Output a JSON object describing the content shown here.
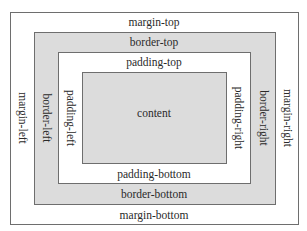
{
  "diagram": {
    "layers": {
      "margin": {
        "top": "margin-top",
        "bottom": "margin-bottom",
        "left": "margin-left",
        "right": "margin-right"
      },
      "border": {
        "top": "border-top",
        "bottom": "border-bottom",
        "left": "border-left",
        "right": "border-right"
      },
      "padding": {
        "top": "padding-top",
        "bottom": "padding-bottom",
        "left": "padding-left",
        "right": "padding-right"
      },
      "content": "content"
    },
    "colors": {
      "shaded": "#dcdcdc",
      "white": "#ffffff",
      "stroke": "#6e6e6e"
    }
  }
}
